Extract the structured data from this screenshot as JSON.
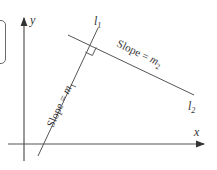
{
  "diagram": {
    "axes": {
      "x_label": "x",
      "y_label": "y"
    },
    "lines": [
      {
        "name": "l1",
        "label_main": "l",
        "label_sub": "1",
        "slope_text": "Slope = ",
        "slope_var": "m",
        "slope_sub": "1"
      },
      {
        "name": "l2",
        "label_main": "l",
        "label_sub": "2",
        "slope_text": "Slope = ",
        "slope_var": "m",
        "slope_sub": "2"
      }
    ],
    "right_angle_marker": true,
    "colors": {
      "line": "#555555",
      "text": "#333333",
      "background": "#ffffff"
    }
  }
}
